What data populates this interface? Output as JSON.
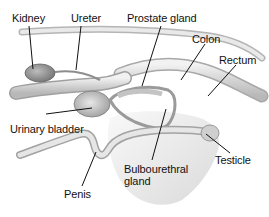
{
  "diagram": {
    "labels": {
      "kidney": "Kidney",
      "ureter": "Ureter",
      "prostate": "Prostate gland",
      "colon": "Colon",
      "rectum": "Rectum",
      "bladder": "Urinary bladder",
      "penis": "Penis",
      "bulbourethral_1": "Bulbourethral",
      "bulbourethral_2": "gland",
      "testicle": "Testicle"
    },
    "colors": {
      "outline": "#8a8a8a",
      "fill_light": "#e6e6e6",
      "fill_mid": "#c9c9c9",
      "fill_dark": "#9a9a9a",
      "leader_line": "#111111",
      "label_text": "#111111"
    }
  }
}
